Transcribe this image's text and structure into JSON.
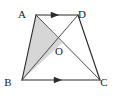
{
  "figure": {
    "labels": {
      "A": "A",
      "B": "B",
      "C": "C",
      "D": "D",
      "O": "O"
    },
    "colors": {
      "outline": "#2b2b2b",
      "diagonal": "#4a4a4a",
      "shading": "#d6d6d6",
      "background": "#ffffff",
      "label_text": "#1a1a1a"
    },
    "points": {
      "A": {
        "x": 36,
        "y": 15
      },
      "D": {
        "x": 78,
        "y": 15
      },
      "B": {
        "x": 22,
        "y": 80
      },
      "C": {
        "x": 100,
        "y": 80
      },
      "O": {
        "x": 62,
        "y": 43
      }
    },
    "label_positions": {
      "A": {
        "x": 22,
        "y": 18
      },
      "D": {
        "x": 82,
        "y": 18
      },
      "B": {
        "x": 8,
        "y": 86
      },
      "C": {
        "x": 104,
        "y": 86
      },
      "O": {
        "x": 59,
        "y": 55
      }
    },
    "segments": [
      {
        "name": "segment-AD",
        "from": "A",
        "to": "D",
        "style": "outline"
      },
      {
        "name": "segment-AB",
        "from": "A",
        "to": "B",
        "style": "outline"
      },
      {
        "name": "segment-BC",
        "from": "B",
        "to": "C",
        "style": "outline"
      },
      {
        "name": "segment-DC",
        "from": "D",
        "to": "C",
        "style": "outline"
      },
      {
        "name": "diagonal-AC",
        "from": "A",
        "to": "C",
        "style": "diagonal"
      },
      {
        "name": "diagonal-BD",
        "from": "B",
        "to": "D",
        "style": "diagonal"
      }
    ],
    "arrow_markers": [
      {
        "name": "arrow-on-AD",
        "on_segment": "AD",
        "x": 55,
        "y": 15,
        "direction": "right"
      },
      {
        "name": "arrow-on-BC",
        "on_segment": "BC",
        "x": 58,
        "y": 80,
        "direction": "right"
      }
    ],
    "shaded_triangle": {
      "name": "triangle-ABO",
      "vertices": [
        "A",
        "B",
        "O"
      ],
      "fill": "#d6d6d6"
    }
  }
}
